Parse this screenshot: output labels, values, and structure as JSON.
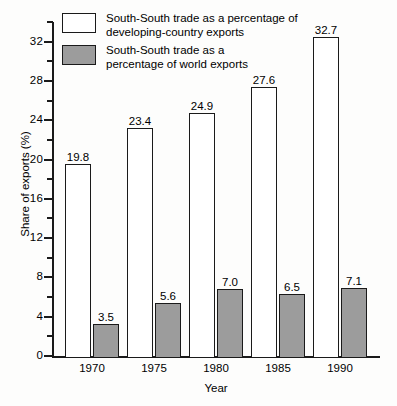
{
  "chart_data": {
    "type": "bar",
    "title": "",
    "xlabel": "Year",
    "ylabel": "Share of exports (%)",
    "categories": [
      "1970",
      "1975",
      "1980",
      "1985",
      "1990"
    ],
    "ylim": [
      0,
      34
    ],
    "y_major_ticks": [
      "0",
      "4",
      "8",
      "12",
      "16",
      "20",
      "24",
      "28",
      "32"
    ],
    "y_minor_tick_values": [
      2,
      6,
      10,
      14,
      18,
      22,
      26,
      30,
      34
    ],
    "grid": false,
    "legend_position": "top-left-inside",
    "series": [
      {
        "name": "South-South trade as a percentage of\ndeveloping-country exports",
        "color": "#ffffff",
        "values": [
          19.8,
          23.4,
          24.9,
          27.6,
          32.7
        ],
        "labels": [
          "19.8",
          "23.4",
          "24.9",
          "27.6",
          "32.7"
        ]
      },
      {
        "name": "South-South trade as a\npercentage of world exports",
        "color": "#9c9c9c",
        "values": [
          3.5,
          5.6,
          7.0,
          6.5,
          7.1
        ],
        "labels": [
          "3.5",
          "5.6",
          "7.0",
          "6.5",
          "7.1"
        ]
      }
    ]
  },
  "colors": {
    "series_light": "#ffffff",
    "series_dark": "#9c9c9c",
    "axis": "#1a1a1a",
    "background": "#fdfdfc"
  }
}
